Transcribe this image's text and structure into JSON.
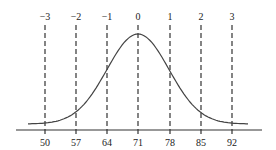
{
  "figure": {
    "z_scores": [
      "−3",
      "−2",
      "−1",
      "0",
      "1",
      "2",
      "3"
    ],
    "raw_scores": [
      "50",
      "57",
      "64",
      "71",
      "78",
      "85",
      "92"
    ],
    "mean": 71,
    "standard_deviation": 7,
    "line_color": "#333333",
    "curve_color": "#444444"
  },
  "chart_data": {
    "type": "line",
    "title": "",
    "xlabel": "",
    "ylabel": "",
    "x": [
      50,
      57,
      64,
      71,
      78,
      85,
      92
    ],
    "z": [
      -3,
      -2,
      -1,
      0,
      1,
      2,
      3
    ],
    "top_tick_labels": [
      "−3",
      "−2",
      "−1",
      "0",
      "1",
      "2",
      "3"
    ],
    "bottom_tick_labels": [
      "50",
      "57",
      "64",
      "71",
      "78",
      "85",
      "92"
    ],
    "series": [
      {
        "name": "normal curve",
        "shape": "bell",
        "mean": 71,
        "sd": 7
      }
    ],
    "grid": false,
    "vertical_dashed_lines_at": [
      50,
      57,
      64,
      71,
      78,
      85,
      92
    ]
  }
}
